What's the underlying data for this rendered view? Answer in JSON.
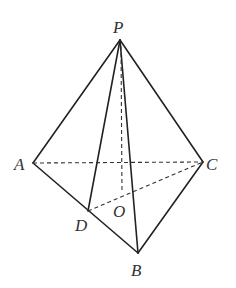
{
  "diagram": {
    "type": "pyramid",
    "colors": {
      "line": "#222222",
      "label": "#333333",
      "background": "#ffffff"
    },
    "labels": {
      "P": "P",
      "A": "A",
      "B": "B",
      "C": "C",
      "D": "D",
      "O": "O"
    },
    "points": {
      "P": [
        120,
        40
      ],
      "A": [
        33,
        163
      ],
      "B": [
        138,
        253
      ],
      "C": [
        203,
        162
      ],
      "D": [
        88,
        211
      ],
      "O": [
        122,
        193
      ]
    },
    "solid_edges": [
      "PA",
      "PB",
      "PC",
      "PD",
      "AB",
      "BC"
    ],
    "dashed_edges": [
      "AC",
      "PO",
      "DC"
    ]
  }
}
